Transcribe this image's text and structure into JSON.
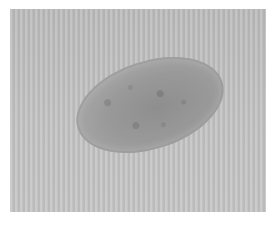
{
  "image": {
    "subject": "microscopy image of an oval egg",
    "background_color": "#c2c2c2",
    "egg_color": "#959595",
    "border_color": "#ffffff"
  }
}
